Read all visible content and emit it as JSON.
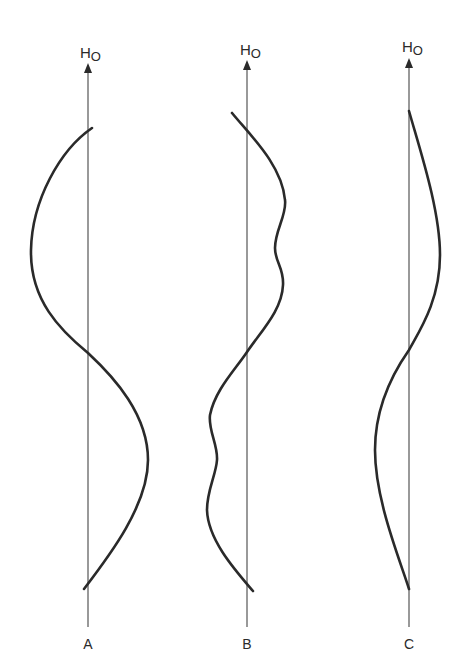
{
  "diagram": {
    "type": "field-profile-comparison",
    "panels": [
      {
        "id": "A",
        "label": "A",
        "axis_label_main": "H",
        "axis_label_sub": "O",
        "axis_x": 88,
        "description": "smooth single-period sinusoid: bulges left in upper half, crosses axis at center, bulges right in lower half"
      },
      {
        "id": "B",
        "label": "B",
        "axis_label_main": "H",
        "axis_label_sub": "O",
        "axis_x": 247,
        "description": "sinusoid-like profile with wavy ripples: bulges right with two bumps in upper half, crosses at center, bulges left with two bumps in lower half"
      },
      {
        "id": "C",
        "label": "C",
        "axis_label_main": "H",
        "axis_label_sub": "O",
        "axis_x": 409,
        "description": "asymmetric profile: bulges right in upper half, crosses axis at center, bulges left in lower half; ends on axis"
      }
    ]
  }
}
